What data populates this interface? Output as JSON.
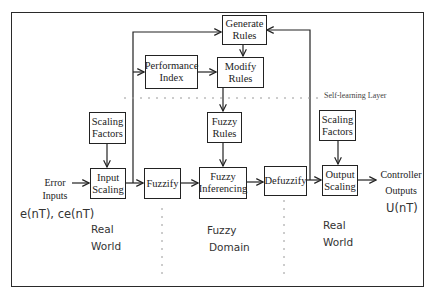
{
  "diagram": {
    "blocks": {
      "generate_rules": {
        "line1": "Generate",
        "line2": "Rules"
      },
      "modify_rules": {
        "line1": "Modify",
        "line2": "Rules"
      },
      "performance_index": {
        "line1": "Performance",
        "line2": "Index"
      },
      "scaling_factors_in": {
        "line1": "Scaling",
        "line2": "Factors"
      },
      "fuzzy_rules": {
        "line1": "Fuzzy",
        "line2": "Rules"
      },
      "scaling_factors_out": {
        "line1": "Scaling",
        "line2": "Factors"
      },
      "input_scaling": {
        "line1": "Input",
        "line2": "Scaling"
      },
      "fuzzify": {
        "line1": "Fuzzify"
      },
      "fuzzy_inferencing": {
        "line1": "Fuzzy",
        "line2": "Inferencing"
      },
      "defuzzify": {
        "line1": "Defuzzify"
      },
      "output_scaling": {
        "line1": "Output",
        "line2": "Scaling"
      }
    },
    "labels": {
      "error_inputs": {
        "line1": "Error",
        "line2": "Inputs"
      },
      "input_signals": "e(nT), ce(nT)",
      "controller_outputs": {
        "line1": "Controller",
        "line2": "Outputs"
      },
      "output_signal": "U(nT)",
      "self_learning_layer": "Self-learning Layer",
      "domain_left": {
        "line1": "Real",
        "line2": "World"
      },
      "domain_center": {
        "line1": "Fuzzy",
        "line2": "Domain"
      },
      "domain_right": {
        "line1": "Real",
        "line2": "World"
      }
    },
    "colors": {
      "stroke": "#222222",
      "dashed": "#9a9a9a",
      "background": "#ffffff"
    }
  }
}
